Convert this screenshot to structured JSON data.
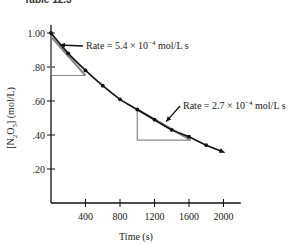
{
  "figure": {
    "title_fragment": "Table 12.3"
  },
  "chart_data": {
    "type": "line",
    "title": "",
    "xlabel": "Time (s)",
    "ylabel": "[N2O5] (mol/L)",
    "ylabel_parts": {
      "pre": "[N",
      "sub1": "2",
      "mid": "O",
      "sub2": "5",
      "post": "] (mol/L)"
    },
    "xlim": [
      0,
      2200
    ],
    "ylim": [
      0,
      1.0
    ],
    "x_ticks": [
      400,
      800,
      1200,
      1600,
      2000
    ],
    "x_tick_labels": [
      "400",
      "800",
      "1200",
      "1600",
      "2000"
    ],
    "y_ticks": [
      0.2,
      0.4,
      0.6,
      0.8,
      1.0
    ],
    "y_tick_labels": [
      ".20",
      ".40",
      ".60",
      ".80",
      "1.00"
    ],
    "grid": false,
    "legend": null,
    "series": [
      {
        "name": "[N2O5] vs time",
        "x": [
          0,
          200,
          400,
          600,
          800,
          1000,
          1200,
          1400,
          1600,
          1800,
          2000
        ],
        "values": [
          1.0,
          0.88,
          0.78,
          0.69,
          0.61,
          0.55,
          0.49,
          0.43,
          0.39,
          0.34,
          0.3
        ]
      }
    ],
    "tangents": [
      {
        "at_t": 0,
        "rise_from": 0.98,
        "rise_to": 0.75,
        "run_to": 400
      },
      {
        "at_t": 1000,
        "rise_from": 0.55,
        "rise_to": 0.37,
        "run_to": 1620
      }
    ],
    "annotations": [
      {
        "text_pre": "Rate = 5.4 × 10",
        "sup": "−4",
        "text_post": " mol/L s",
        "point_t": 80,
        "point_c": 0.93
      },
      {
        "text_pre": "Rate = 2.7 × 10",
        "sup": "−4",
        "text_post": " mol/L s",
        "point_t": 1320,
        "point_c": 0.47
      }
    ]
  }
}
